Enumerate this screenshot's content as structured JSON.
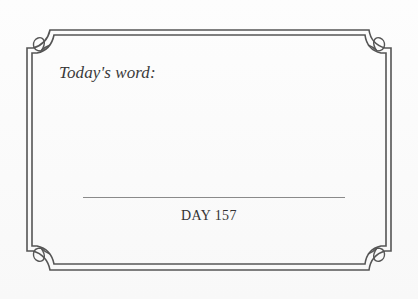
{
  "card": {
    "label": "Today's word:",
    "day_text": "DAY 157",
    "colors": {
      "frame": "#555555",
      "text": "#333333",
      "rule": "#8a8a8a",
      "background": "#fbfbfb"
    },
    "decorations": {
      "frame_style": "double-line-notched-corners",
      "corner_ornament": "leaf-flourish-icon"
    }
  }
}
